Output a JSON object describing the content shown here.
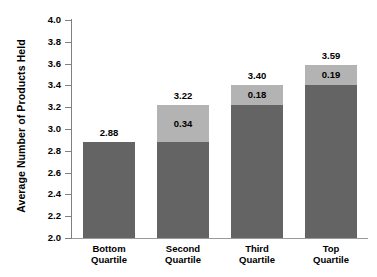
{
  "chart_data": {
    "type": "bar",
    "subtype": "stacked-bar",
    "title": "",
    "xlabel": "",
    "ylabel": "Average Number of Products Held",
    "ylim": [
      2.0,
      4.0
    ],
    "ytick_step": 0.2,
    "yticks": [
      "4.0",
      "3.8",
      "3.6",
      "3.4",
      "3.2",
      "3.0",
      "2.8",
      "2.6",
      "2.4",
      "2.2",
      "2.0"
    ],
    "ytick_values": [
      4.0,
      3.8,
      3.6,
      3.4,
      3.2,
      3.0,
      2.8,
      2.6,
      2.4,
      2.2,
      2.0
    ],
    "grid": false,
    "legend": false,
    "legend_position": "none",
    "background_color": "#ffffff",
    "categories": [
      "Bottom Quartile",
      "Second Quartile",
      "Third Quartile",
      "Top Quartile"
    ],
    "category_lines": [
      [
        "Bottom",
        "Quartile"
      ],
      [
        "Second",
        "Quartile"
      ],
      [
        "Third",
        "Quartile"
      ],
      [
        "Top",
        "Quartile"
      ]
    ],
    "series": [
      {
        "name": "base",
        "color": "#646464",
        "values": [
          2.88,
          2.88,
          3.22,
          3.4
        ]
      },
      {
        "name": "increment",
        "color": "#b3b3b3",
        "values": [
          0.0,
          0.34,
          0.18,
          0.19
        ]
      }
    ],
    "totals": [
      2.88,
      3.22,
      3.4,
      3.59
    ],
    "total_labels": [
      "2.88",
      "3.22",
      "3.40",
      "3.59"
    ],
    "segment_labels": [
      "",
      "0.34",
      "0.18",
      "0.19"
    ],
    "bars": [
      {
        "category": "Bottom Quartile",
        "total": 2.88,
        "total_label": "2.88",
        "base": 2.88,
        "increment": 0.0,
        "increment_label": ""
      },
      {
        "category": "Second Quartile",
        "total": 3.22,
        "total_label": "3.22",
        "base": 2.88,
        "increment": 0.34,
        "increment_label": "0.34"
      },
      {
        "category": "Third Quartile",
        "total": 3.4,
        "total_label": "3.40",
        "base": 3.22,
        "increment": 0.18,
        "increment_label": "0.18"
      },
      {
        "category": "Top Quartile",
        "total": 3.59,
        "total_label": "3.59",
        "base": 3.4,
        "increment": 0.19,
        "increment_label": "0.19"
      }
    ]
  }
}
